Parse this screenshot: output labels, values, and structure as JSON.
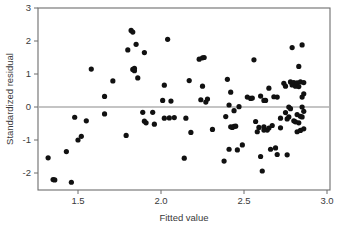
{
  "chart_data": {
    "type": "scatter",
    "title": "",
    "xlabel": "Fitted value",
    "ylabel": "Standardized residual",
    "xlim": [
      1.28,
      3.04
    ],
    "ylim": [
      -2.45,
      3.0
    ],
    "xticks": [
      1.5,
      2.0,
      2.5,
      3.0
    ],
    "xtick_labels": [
      "1.5",
      "2.0",
      "2.5",
      "3.0"
    ],
    "yticks": [
      -2,
      -1,
      0,
      1,
      2,
      3
    ],
    "ytick_labels": [
      "-2",
      "-1",
      "0",
      "1",
      "2",
      "3"
    ],
    "grid": false,
    "legend": null,
    "reference_lines": [
      {
        "orientation": "horizontal",
        "y": 0,
        "color": "#8a8a8a"
      }
    ],
    "marker": {
      "shape": "circle",
      "color": "#111111",
      "size_px": 2.6
    },
    "n_points": 118,
    "points": [
      [
        1.32,
        -1.54
      ],
      [
        1.35,
        -2.2
      ],
      [
        1.36,
        -2.21
      ],
      [
        1.43,
        -1.35
      ],
      [
        1.46,
        -2.28
      ],
      [
        1.48,
        -0.31
      ],
      [
        1.5,
        -1.0
      ],
      [
        1.52,
        -0.89
      ],
      [
        1.55,
        -0.42
      ],
      [
        1.58,
        1.15
      ],
      [
        1.66,
        -0.21
      ],
      [
        1.66,
        0.32
      ],
      [
        1.71,
        0.79
      ],
      [
        1.79,
        -0.86
      ],
      [
        1.8,
        1.73
      ],
      [
        1.82,
        2.32
      ],
      [
        1.83,
        2.27
      ],
      [
        1.83,
        1.14
      ],
      [
        1.84,
        1.1
      ],
      [
        1.84,
        1.17
      ],
      [
        1.85,
        1.9
      ],
      [
        1.86,
        0.88
      ],
      [
        1.89,
        -0.16
      ],
      [
        1.9,
        1.65
      ],
      [
        1.9,
        -0.43
      ],
      [
        1.91,
        -0.48
      ],
      [
        1.95,
        -0.16
      ],
      [
        1.96,
        -0.52
      ],
      [
        2.01,
        0.2
      ],
      [
        2.02,
        0.66
      ],
      [
        2.02,
        -0.34
      ],
      [
        2.04,
        2.05
      ],
      [
        2.05,
        -0.33
      ],
      [
        2.06,
        0.18
      ],
      [
        2.08,
        -0.32
      ],
      [
        2.14,
        -1.55
      ],
      [
        2.15,
        -0.34
      ],
      [
        2.17,
        0.8
      ],
      [
        2.18,
        -0.77
      ],
      [
        2.23,
        1.45
      ],
      [
        2.24,
        0.22
      ],
      [
        2.25,
        0.63
      ],
      [
        2.25,
        1.49
      ],
      [
        2.26,
        1.5
      ],
      [
        2.27,
        0.15
      ],
      [
        2.28,
        0.24
      ],
      [
        2.31,
        -0.68
      ],
      [
        2.38,
        -1.64
      ],
      [
        2.39,
        -0.29
      ],
      [
        2.4,
        0.84
      ],
      [
        2.41,
        0.06
      ],
      [
        2.41,
        -1.28
      ],
      [
        2.42,
        0.45
      ],
      [
        2.42,
        -0.6
      ],
      [
        2.43,
        -0.62
      ],
      [
        2.44,
        -0.11
      ],
      [
        2.44,
        -0.59
      ],
      [
        2.45,
        -0.58
      ],
      [
        2.46,
        -1.3
      ],
      [
        2.47,
        0.01
      ],
      [
        2.49,
        -1.15
      ],
      [
        2.54,
        0.26
      ],
      [
        2.55,
        0.27
      ],
      [
        2.56,
        1.43
      ],
      [
        2.57,
        -0.44
      ],
      [
        2.58,
        -0.75
      ],
      [
        2.59,
        -0.62
      ],
      [
        2.6,
        -1.5
      ],
      [
        2.6,
        0.33
      ],
      [
        2.61,
        -1.94
      ],
      [
        2.62,
        -0.6
      ],
      [
        2.62,
        -0.7
      ],
      [
        2.63,
        0.2
      ],
      [
        2.64,
        -0.7
      ],
      [
        2.65,
        0.57
      ],
      [
        2.65,
        -0.64
      ],
      [
        2.66,
        -1.28
      ],
      [
        2.67,
        -0.56
      ],
      [
        2.68,
        0.31
      ],
      [
        2.69,
        -1.24
      ],
      [
        2.7,
        -1.44
      ],
      [
        2.72,
        -0.63
      ],
      [
        2.74,
        0.72
      ],
      [
        2.75,
        0.63
      ],
      [
        2.75,
        -0.17
      ],
      [
        2.76,
        -0.36
      ],
      [
        2.76,
        -1.45
      ],
      [
        2.77,
        -0.3
      ],
      [
        2.77,
        0.0
      ],
      [
        2.78,
        -0.05
      ],
      [
        2.78,
        0.76
      ],
      [
        2.79,
        1.8
      ],
      [
        2.79,
        0.67
      ],
      [
        2.8,
        -0.42
      ],
      [
        2.8,
        0.74
      ],
      [
        2.81,
        -0.45
      ],
      [
        2.81,
        0.63
      ],
      [
        2.82,
        -0.23
      ],
      [
        2.82,
        0.73
      ],
      [
        2.82,
        -0.75
      ],
      [
        2.83,
        1.23
      ],
      [
        2.83,
        -0.48
      ],
      [
        2.83,
        0.62
      ],
      [
        2.84,
        0.76
      ],
      [
        2.84,
        -0.28
      ],
      [
        2.84,
        -0.71
      ],
      [
        2.85,
        1.88
      ],
      [
        2.85,
        0.3
      ],
      [
        2.85,
        0.0
      ],
      [
        2.85,
        -0.3
      ],
      [
        2.86,
        0.74
      ],
      [
        2.86,
        -0.13
      ],
      [
        2.86,
        -0.66
      ],
      [
        2.72,
        -0.34
      ],
      [
        2.7,
        0.3
      ],
      [
        2.52,
        0.3
      ],
      [
        2.62,
        0.2
      ],
      [
        2.86,
        0.4
      ]
    ]
  }
}
